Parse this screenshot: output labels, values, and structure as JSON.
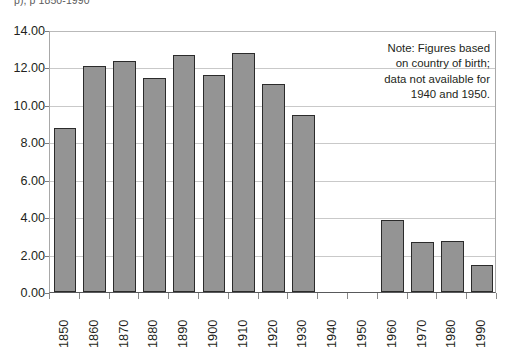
{
  "title_clipped": "p),                                     p 1850-1990",
  "note": {
    "lines": [
      "Note: Figures based",
      "on country of birth;",
      "data not available for",
      "1940 and 1950."
    ]
  },
  "axis": {
    "y_ticks": [
      "0.00",
      "2.00",
      "4.00",
      "6.00",
      "8.00",
      "10.00",
      "12.00",
      "14.00"
    ],
    "x_ticks": [
      "1850",
      "1860",
      "1870",
      "1880",
      "1890",
      "1900",
      "1910",
      "1920",
      "1930",
      "1940",
      "1950",
      "1960",
      "1970",
      "1980",
      "1990"
    ]
  },
  "colors": {
    "bar_fill": "#949494",
    "bar_border": "#2b2b2b",
    "gridline": "#c9c9c9",
    "axis": "#58595b",
    "text": "#231f20",
    "background": "#ffffff"
  },
  "chart_data": {
    "type": "bar",
    "title": "",
    "xlabel": "",
    "ylabel": "",
    "ylim": [
      0,
      14
    ],
    "ytick_step": 2,
    "grid": true,
    "legend": "none",
    "categories": [
      "1850",
      "1860",
      "1870",
      "1880",
      "1890",
      "1900",
      "1910",
      "1920",
      "1930",
      "1940",
      "1950",
      "1960",
      "1970",
      "1980",
      "1990"
    ],
    "values": [
      8.75,
      12.1,
      12.35,
      11.45,
      12.65,
      11.6,
      12.75,
      11.1,
      9.45,
      null,
      null,
      3.85,
      2.65,
      2.75,
      1.45
    ],
    "annotations": [
      "Note: Figures based on country of birth; data not available for 1940 and 1950."
    ]
  }
}
